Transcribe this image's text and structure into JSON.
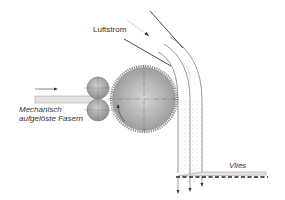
{
  "labels": {
    "airflow": "Luftstrom",
    "fibers_line1": "Mechanisch",
    "fibers_line2": "aufgelöste Fasern",
    "web": "Vlies"
  },
  "components": {
    "feed_rollers": "feed-roller-pair",
    "drum": "toothed-opening-drum",
    "air_channel": "curved-air-duct",
    "conveyor": "perforated-conveyor-belt"
  },
  "colors": {
    "line": "#333333",
    "drum_fill": "#b8b8b8",
    "roller_fill": "#a8a8a8",
    "feed_fill": "#e2e2e2",
    "fiber_dots": "#9a9a9a",
    "airflow_line": "#c8c8c8"
  }
}
